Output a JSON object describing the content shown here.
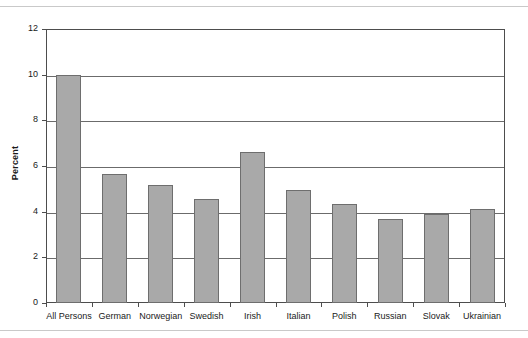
{
  "chart_data": {
    "type": "bar",
    "title": "",
    "xlabel": "",
    "ylabel": "Percent",
    "ylim": [
      0,
      12
    ],
    "yticks": [
      0,
      2,
      4,
      6,
      8,
      10,
      12
    ],
    "ytick_labels": [
      "0",
      "2",
      "4",
      "6",
      "8",
      "10",
      "12"
    ],
    "grid": true,
    "legend": "none",
    "categories": [
      "All Persons",
      "German",
      "Norwegian",
      "Swedish",
      "Irish",
      "Italian",
      "Polish",
      "Russian",
      "Slovak",
      "Ukrainian"
    ],
    "values": [
      10.0,
      5.65,
      5.15,
      4.55,
      6.6,
      4.95,
      4.35,
      3.7,
      3.9,
      4.1
    ],
    "bar_color": "#a9a9a9",
    "bar_edge_color": "#6e6e6e",
    "axis_color": "#4d4d4d",
    "gridline_color": "#6b6b6b",
    "background_color": "#ffffff"
  }
}
